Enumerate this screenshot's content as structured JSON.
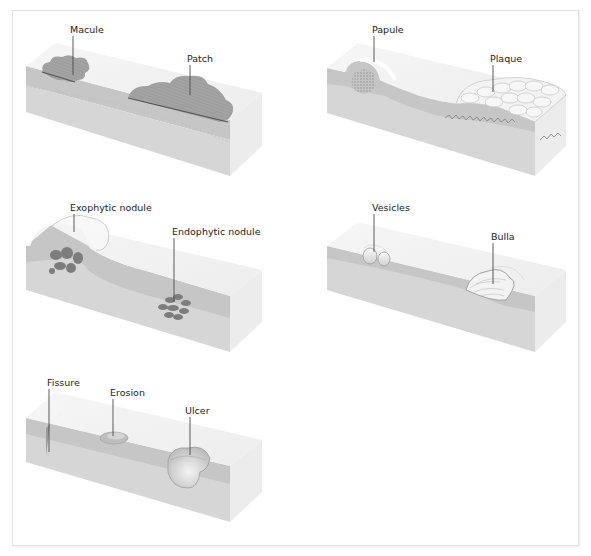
{
  "figure": {
    "panels": [
      {
        "id": "flat",
        "labels": [
          "Macule",
          "Patch"
        ]
      },
      {
        "id": "raised",
        "labels": [
          "Papule",
          "Plaque"
        ]
      },
      {
        "id": "nodules",
        "labels": [
          "Exophytic nodule",
          "Endophytic nodule"
        ]
      },
      {
        "id": "fluid",
        "labels": [
          "Vesicles",
          "Bulla"
        ]
      },
      {
        "id": "loss",
        "labels": [
          "Fissure",
          "Erosion",
          "Ulcer"
        ]
      }
    ]
  },
  "colors": {
    "top_face": "#f2f2f2",
    "epidermis": "#c9c9c9",
    "dermis": "#d8d8d8",
    "side_face": "#ebebeb",
    "lesion": "#9a9a9a",
    "lesion_dark": "#7a7a7a",
    "frame": "#e2e2e2"
  }
}
